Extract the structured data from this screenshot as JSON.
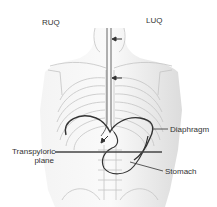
{
  "diagram": {
    "labels": {
      "ruq": "RUQ",
      "luq": "LUQ",
      "diaphragm": "Diaphragm",
      "transpyloric_line1": "Transpyloric",
      "transpyloric_line2": "plane",
      "stomach": "Stomach"
    },
    "colors": {
      "skeleton": "#bdbdbd",
      "body_shade": "#e6e6e6",
      "outline": "#333333",
      "text": "#333333"
    }
  }
}
